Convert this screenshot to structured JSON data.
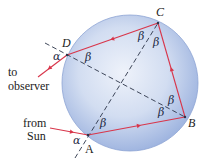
{
  "diagram": {
    "colors": {
      "sphere_center": "#eef2fa",
      "sphere_edge": "#9db3df",
      "sphere_outline": "#8ea5d4",
      "ray": "#d8354a",
      "dash": "#2b3448"
    },
    "points": {
      "A": "A",
      "B": "B",
      "C": "C",
      "D": "D"
    },
    "labels": {
      "to_observer_line1": "to",
      "to_observer_line2": "observer",
      "from_sun_line1": "from",
      "from_sun_line2": "Sun"
    },
    "angles": {
      "alpha": "α",
      "beta": "β"
    }
  }
}
